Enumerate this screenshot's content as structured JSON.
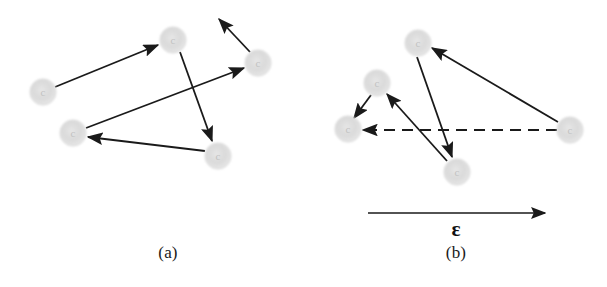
{
  "figure": {
    "width": 607,
    "height": 287,
    "background_color": "#ffffff",
    "stroke_color": "#1a1a1a",
    "node_color": "#dcdcdc",
    "node_edge_color": "#cfcfcf",
    "node_inner_glyph": "c",
    "node_radius": 13,
    "arrow_stroke_width": 1.8
  },
  "panels": [
    {
      "id": "panel-a",
      "caption": "(a)",
      "caption_x": 168,
      "caption_y": 258,
      "description": "Five gray particles connected by solid directed arrows, no external field.",
      "nodes": [
        {
          "name": "node-a-left",
          "x": 43,
          "y": 92,
          "label": "c"
        },
        {
          "name": "node-a-top",
          "x": 173,
          "y": 40,
          "label": "c"
        },
        {
          "name": "node-a-right",
          "x": 258,
          "y": 63,
          "label": "c"
        },
        {
          "name": "node-a-lower-left",
          "x": 73,
          "y": 133,
          "label": "c"
        },
        {
          "name": "node-a-lower-right",
          "x": 218,
          "y": 156,
          "label": "c"
        }
      ],
      "arrows": [
        {
          "name": "arrow-a-left-to-top",
          "x1": 55,
          "y1": 87,
          "x2": 158,
          "y2": 45,
          "style": "solid"
        },
        {
          "name": "arrow-a-top-to-lower-right",
          "x1": 180,
          "y1": 52,
          "x2": 212,
          "y2": 141,
          "style": "solid"
        },
        {
          "name": "arrow-a-lower-left-to-right",
          "x1": 86,
          "y1": 128,
          "x2": 244,
          "y2": 68,
          "style": "solid"
        },
        {
          "name": "arrow-a-lower-right-to-lower-left",
          "x1": 205,
          "y1": 151,
          "x2": 88,
          "y2": 137,
          "style": "solid"
        },
        {
          "name": "arrow-a-right-to-upper-left",
          "x1": 250,
          "y1": 52,
          "x2": 219,
          "y2": 19,
          "style": "solid"
        }
      ]
    },
    {
      "id": "panel-b",
      "caption": "(b)",
      "caption_x": 456,
      "caption_y": 258,
      "description": "Five gray particles with solid directed arrows plus one dashed arrow, under an applied external field epsilon.",
      "nodes": [
        {
          "name": "node-b-top",
          "x": 418,
          "y": 43,
          "label": "c"
        },
        {
          "name": "node-b-upper-left",
          "x": 377,
          "y": 83,
          "label": "c"
        },
        {
          "name": "node-b-far-left",
          "x": 348,
          "y": 129,
          "label": "c"
        },
        {
          "name": "node-b-bottom",
          "x": 457,
          "y": 172,
          "label": "c"
        },
        {
          "name": "node-b-far-right",
          "x": 570,
          "y": 130,
          "label": "c"
        }
      ],
      "arrows": [
        {
          "name": "arrow-b-far-right-to-top",
          "x1": 558,
          "y1": 122,
          "x2": 432,
          "y2": 48,
          "style": "solid"
        },
        {
          "name": "arrow-b-top-to-bottom",
          "x1": 417,
          "y1": 57,
          "x2": 452,
          "y2": 157,
          "style": "solid"
        },
        {
          "name": "arrow-b-bottom-to-upper-left",
          "x1": 447,
          "y1": 161,
          "x2": 387,
          "y2": 94,
          "style": "solid"
        },
        {
          "name": "arrow-b-upper-left-to-far-left",
          "x1": 371,
          "y1": 95,
          "x2": 354,
          "y2": 118,
          "style": "solid"
        },
        {
          "name": "arrow-b-far-right-to-far-left-dashed",
          "x1": 557,
          "y1": 130,
          "x2": 363,
          "y2": 130,
          "style": "dashed"
        }
      ],
      "field_arrow": {
        "name": "field-arrow",
        "x1": 368,
        "y1": 213,
        "x2": 545,
        "y2": 213,
        "label": "ɛ",
        "label_x": 456,
        "label_y": 236
      }
    }
  ]
}
